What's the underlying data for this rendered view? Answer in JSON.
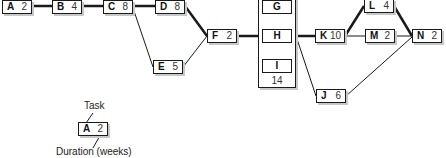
{
  "diagram": {
    "type": "project-network (activity-on-node)",
    "nodes": [
      {
        "id": "A",
        "task": "A",
        "duration": "2"
      },
      {
        "id": "B",
        "task": "B",
        "duration": "4"
      },
      {
        "id": "C",
        "task": "C",
        "duration": "8"
      },
      {
        "id": "D",
        "task": "D",
        "duration": "8"
      },
      {
        "id": "E",
        "task": "E",
        "duration": "5"
      },
      {
        "id": "F",
        "task": "F",
        "duration": "2"
      },
      {
        "id": "K",
        "task": "K",
        "duration": "10"
      },
      {
        "id": "L",
        "task": "L",
        "duration": "4"
      },
      {
        "id": "M",
        "task": "M",
        "duration": "2"
      },
      {
        "id": "N",
        "task": "N",
        "duration": "2"
      },
      {
        "id": "J",
        "task": "J",
        "duration": "6"
      }
    ],
    "parallel_group": {
      "tasks": [
        "G",
        "H",
        "I"
      ],
      "duration": "14"
    },
    "edges": [
      {
        "from": "A",
        "to": "B",
        "critical": true
      },
      {
        "from": "B",
        "to": "C",
        "critical": true
      },
      {
        "from": "C",
        "to": "D",
        "critical": true
      },
      {
        "from": "C",
        "to": "E",
        "critical": false
      },
      {
        "from": "D",
        "to": "F",
        "critical": true
      },
      {
        "from": "E",
        "to": "F",
        "critical": false
      },
      {
        "from": "F",
        "to": "GHI",
        "critical": true
      },
      {
        "from": "GHI",
        "to": "K",
        "critical": true
      },
      {
        "from": "GHI",
        "to": "J",
        "critical": false
      },
      {
        "from": "K",
        "to": "L",
        "critical": true
      },
      {
        "from": "K",
        "to": "M",
        "critical": false
      },
      {
        "from": "L",
        "to": "N",
        "critical": true
      },
      {
        "from": "M",
        "to": "N",
        "critical": false
      },
      {
        "from": "J",
        "to": "N",
        "critical": false
      }
    ]
  },
  "legend": {
    "task_label": "Task",
    "duration_label": "Duration (weeks)",
    "example_task": "A",
    "example_duration": "2"
  },
  "colors": {
    "line": "#1a1a1a",
    "shadow": "#c8c8c8",
    "background": "#ffffff"
  }
}
